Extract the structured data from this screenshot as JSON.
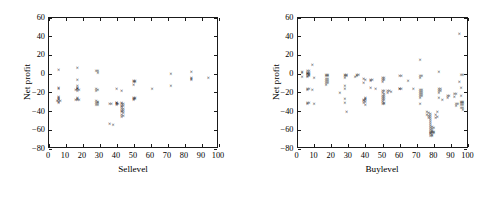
{
  "figure": {
    "background": "#ffffff",
    "marker_color": "#000000",
    "axis_color": "#1a1a1a",
    "marker_symbol": "x"
  },
  "chart_data": [
    {
      "type": "scatter",
      "title": "",
      "xlabel": "Sellevel",
      "ylabel": "Net profit",
      "xlim": [
        0,
        100
      ],
      "ylim": [
        -80,
        60
      ],
      "xticks": [
        0,
        10,
        20,
        30,
        40,
        50,
        60,
        70,
        80,
        90,
        100
      ],
      "yticks": [
        -80,
        -60,
        -40,
        -20,
        0,
        20,
        40,
        60
      ],
      "grid": false,
      "legend": "none",
      "marker": "x",
      "points": [
        [
          6,
          4
        ],
        [
          6,
          -15
        ],
        [
          6,
          -16
        ],
        [
          6,
          -25
        ],
        [
          6,
          -26
        ],
        [
          6,
          -27
        ],
        [
          6,
          -28
        ],
        [
          5,
          -29
        ],
        [
          7,
          -29
        ],
        [
          6,
          -30
        ],
        [
          6,
          -31
        ],
        [
          17,
          6
        ],
        [
          17,
          -7
        ],
        [
          17,
          -13
        ],
        [
          17,
          -15
        ],
        [
          17,
          -16
        ],
        [
          17,
          -17
        ],
        [
          16,
          -18
        ],
        [
          18,
          -18
        ],
        [
          17,
          -19
        ],
        [
          17,
          -26
        ],
        [
          17,
          -27
        ],
        [
          17,
          -28
        ],
        [
          16,
          -28
        ],
        [
          18,
          -28
        ],
        [
          28,
          3
        ],
        [
          29,
          3
        ],
        [
          29,
          1
        ],
        [
          28,
          -17
        ],
        [
          29,
          -18
        ],
        [
          28,
          -19
        ],
        [
          28,
          -29
        ],
        [
          29,
          -30
        ],
        [
          28,
          -31
        ],
        [
          29,
          -31
        ],
        [
          28,
          -34
        ],
        [
          29,
          -34
        ],
        [
          36,
          -33
        ],
        [
          37,
          -33
        ],
        [
          36,
          -54
        ],
        [
          38,
          -55
        ],
        [
          40,
          -16
        ],
        [
          40,
          -31
        ],
        [
          40,
          -32
        ],
        [
          40,
          -33
        ],
        [
          41,
          -33
        ],
        [
          40,
          -34
        ],
        [
          43,
          -19
        ],
        [
          43,
          -31
        ],
        [
          43,
          -33
        ],
        [
          44,
          -33
        ],
        [
          43,
          -35
        ],
        [
          44,
          -35
        ],
        [
          43,
          -36
        ],
        [
          43,
          -38
        ],
        [
          44,
          -38
        ],
        [
          43,
          -40
        ],
        [
          44,
          -40
        ],
        [
          43,
          -41
        ],
        [
          44,
          -42
        ],
        [
          43,
          -44
        ],
        [
          44,
          -45
        ],
        [
          43,
          -46
        ],
        [
          50,
          -8
        ],
        [
          51,
          -8
        ],
        [
          50,
          -9
        ],
        [
          51,
          -9
        ],
        [
          50,
          -12
        ],
        [
          50,
          -26
        ],
        [
          51,
          -26
        ],
        [
          50,
          -27
        ],
        [
          51,
          -27
        ],
        [
          50,
          -28
        ],
        [
          61,
          -17
        ],
        [
          72,
          0
        ],
        [
          72,
          -13
        ],
        [
          84,
          2
        ],
        [
          84,
          -5
        ],
        [
          84,
          -6
        ],
        [
          84,
          -7
        ],
        [
          94,
          -5
        ]
      ]
    },
    {
      "type": "scatter",
      "title": "",
      "xlabel": "Buylevel",
      "ylabel": "Net profit",
      "xlim": [
        0,
        100
      ],
      "ylim": [
        -80,
        60
      ],
      "xticks": [
        0,
        10,
        20,
        30,
        40,
        50,
        60,
        70,
        80,
        90,
        100
      ],
      "yticks": [
        -80,
        -60,
        -40,
        -20,
        0,
        20,
        40,
        60
      ],
      "grid": false,
      "legend": "none",
      "marker": "x",
      "points": [
        [
          3,
          2
        ],
        [
          3,
          1
        ],
        [
          3,
          -4
        ],
        [
          6,
          3
        ],
        [
          7,
          3
        ],
        [
          6,
          1
        ],
        [
          7,
          1
        ],
        [
          6,
          0
        ],
        [
          7,
          0
        ],
        [
          6,
          -1
        ],
        [
          7,
          -2
        ],
        [
          6,
          -3
        ],
        [
          7,
          -3
        ],
        [
          6,
          -4
        ],
        [
          9,
          9
        ],
        [
          10,
          -5
        ],
        [
          6,
          -16
        ],
        [
          7,
          -16
        ],
        [
          6,
          -18
        ],
        [
          9,
          -18
        ],
        [
          6,
          -31
        ],
        [
          7,
          -32
        ],
        [
          6,
          -33
        ],
        [
          10,
          -33
        ],
        [
          17,
          -2
        ],
        [
          18,
          -2
        ],
        [
          17,
          -3
        ],
        [
          18,
          -3
        ],
        [
          17,
          -6
        ],
        [
          18,
          -6
        ],
        [
          17,
          -8
        ],
        [
          18,
          -8
        ],
        [
          17,
          -10
        ],
        [
          18,
          -10
        ],
        [
          17,
          -12
        ],
        [
          25,
          -21
        ],
        [
          28,
          -2
        ],
        [
          29,
          -2
        ],
        [
          28,
          -3
        ],
        [
          29,
          -3
        ],
        [
          28,
          -5
        ],
        [
          28,
          -13
        ],
        [
          28,
          -17
        ],
        [
          28,
          -27
        ],
        [
          28,
          -31
        ],
        [
          29,
          -41
        ],
        [
          34,
          -4
        ],
        [
          35,
          -2
        ],
        [
          36,
          -2
        ],
        [
          35,
          -3
        ],
        [
          39,
          -6
        ],
        [
          40,
          -7
        ],
        [
          39,
          -10
        ],
        [
          40,
          -26
        ],
        [
          40,
          -27
        ],
        [
          39,
          -28
        ],
        [
          40,
          -28
        ],
        [
          39,
          -29
        ],
        [
          40,
          -30
        ],
        [
          39,
          -32
        ],
        [
          40,
          -34
        ],
        [
          43,
          -7
        ],
        [
          44,
          -7
        ],
        [
          43,
          -8
        ],
        [
          43,
          -15
        ],
        [
          46,
          -16
        ],
        [
          50,
          -5
        ],
        [
          51,
          -5
        ],
        [
          50,
          -7
        ],
        [
          51,
          -7
        ],
        [
          50,
          -9
        ],
        [
          50,
          -19
        ],
        [
          51,
          -19
        ],
        [
          50,
          -21
        ],
        [
          51,
          -22
        ],
        [
          50,
          -24
        ],
        [
          51,
          -24
        ],
        [
          50,
          -26
        ],
        [
          51,
          -26
        ],
        [
          50,
          -28
        ],
        [
          51,
          -28
        ],
        [
          50,
          -30
        ],
        [
          51,
          -31
        ],
        [
          50,
          -33
        ],
        [
          51,
          -33
        ],
        [
          53,
          -19
        ],
        [
          54,
          -19
        ],
        [
          53,
          -21
        ],
        [
          55,
          -20
        ],
        [
          60,
          -3
        ],
        [
          61,
          -3
        ],
        [
          60,
          -16
        ],
        [
          61,
          -16
        ],
        [
          60,
          -17
        ],
        [
          65,
          -8
        ],
        [
          68,
          -17
        ],
        [
          72,
          15
        ],
        [
          72,
          -3
        ],
        [
          73,
          -3
        ],
        [
          72,
          -5
        ],
        [
          72,
          -18
        ],
        [
          73,
          -18
        ],
        [
          72,
          -20
        ],
        [
          73,
          -20
        ],
        [
          72,
          -22
        ],
        [
          73,
          -22
        ],
        [
          72,
          -24
        ],
        [
          73,
          -24
        ],
        [
          72,
          -26
        ],
        [
          72,
          -33
        ],
        [
          76,
          -41
        ],
        [
          77,
          -42
        ],
        [
          76,
          -44
        ],
        [
          77,
          -45
        ],
        [
          77,
          -47
        ],
        [
          78,
          -43
        ],
        [
          78,
          -45
        ],
        [
          78,
          -48
        ],
        [
          78,
          -50
        ],
        [
          78,
          -52
        ],
        [
          78,
          -54
        ],
        [
          78,
          -56
        ],
        [
          78,
          -58
        ],
        [
          79,
          -57
        ],
        [
          79,
          -59
        ],
        [
          78,
          -60
        ],
        [
          79,
          -61
        ],
        [
          78,
          -62
        ],
        [
          79,
          -63
        ],
        [
          78,
          -64
        ],
        [
          79,
          -64
        ],
        [
          78,
          -65
        ],
        [
          79,
          -66
        ],
        [
          79,
          -67
        ],
        [
          78,
          -67
        ],
        [
          80,
          -62
        ],
        [
          80,
          -64
        ],
        [
          80,
          -58
        ],
        [
          81,
          -47
        ],
        [
          82,
          -46
        ],
        [
          81,
          -44
        ],
        [
          82,
          -41
        ],
        [
          83,
          2
        ],
        [
          83,
          -17
        ],
        [
          84,
          -17
        ],
        [
          83,
          -19
        ],
        [
          84,
          -19
        ],
        [
          83,
          -21
        ],
        [
          83,
          -26
        ],
        [
          85,
          -28
        ],
        [
          88,
          -24
        ],
        [
          89,
          -24
        ],
        [
          88,
          -26
        ],
        [
          92,
          -22
        ],
        [
          93,
          -22
        ],
        [
          92,
          -25
        ],
        [
          93,
          -33
        ],
        [
          94,
          -33
        ],
        [
          93,
          -35
        ],
        [
          95,
          42
        ],
        [
          95,
          -9
        ],
        [
          96,
          -2
        ],
        [
          97,
          -2
        ],
        [
          96,
          -15
        ],
        [
          96,
          -24
        ],
        [
          96,
          -30
        ],
        [
          97,
          -30
        ],
        [
          96,
          -32
        ],
        [
          97,
          -32
        ],
        [
          96,
          -34
        ],
        [
          97,
          -34
        ],
        [
          97,
          -37
        ],
        [
          96,
          -37
        ],
        [
          97,
          -39
        ]
      ]
    }
  ]
}
